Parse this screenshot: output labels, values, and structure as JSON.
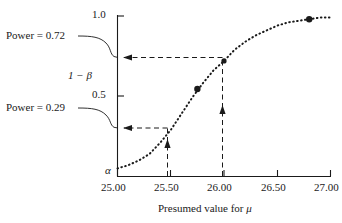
{
  "figure": {
    "type": "power-curve-plot",
    "background": "#ffffff",
    "ink": "#1a1a1a"
  },
  "axes": {
    "x": {
      "title_prefix": "Presumed value for ",
      "title_symbol": "μ",
      "ticks": [
        "25.00",
        "25.50",
        "26.00",
        "26.50",
        "27.00"
      ],
      "range": [
        25.0,
        27.0
      ]
    },
    "y": {
      "ticks": [
        "0.5",
        "1.0"
      ],
      "tick_values": [
        0.5,
        1.0
      ],
      "range": [
        0.0,
        1.0
      ],
      "inner_label": "1 − β",
      "origin_label": "α"
    }
  },
  "callouts": [
    {
      "id": "power-072",
      "text": "Power = 0.72",
      "value": 0.72,
      "target_x": 26.0
    },
    {
      "id": "power-029",
      "text": "Power = 0.29",
      "value": 0.29,
      "target_x": 25.5
    }
  ],
  "chart_data": {
    "type": "line",
    "title": "",
    "subtitle": "",
    "xlabel": "Presumed value for μ",
    "ylabel": "1 − β",
    "xlim": [
      25.0,
      27.0
    ],
    "ylim": [
      0.0,
      1.0
    ],
    "grid": false,
    "legend": null,
    "linestyle": "dotted",
    "series": [
      {
        "name": "Power curve",
        "x": [
          25.0,
          25.1,
          25.2,
          25.3,
          25.4,
          25.5,
          25.6,
          25.7,
          25.8,
          25.9,
          26.0,
          26.1,
          26.2,
          26.3,
          26.4,
          26.5,
          26.6,
          26.7,
          26.8,
          26.9,
          27.0
        ],
        "values": [
          0.05,
          0.07,
          0.1,
          0.14,
          0.21,
          0.29,
          0.39,
          0.49,
          0.58,
          0.66,
          0.72,
          0.79,
          0.84,
          0.88,
          0.91,
          0.94,
          0.96,
          0.97,
          0.98,
          0.99,
          0.99
        ]
      }
    ],
    "markers": [
      {
        "x": 25.75,
        "y": 0.545,
        "style": "filled-dot"
      },
      {
        "x": 26.0,
        "y": 0.72,
        "style": "filled-dot"
      },
      {
        "x": 26.8,
        "y": 0.98,
        "style": "filled-dot"
      }
    ],
    "annotations": [
      {
        "type": "guide",
        "from_x": 25.5,
        "to_y": 0.29,
        "label": "Power = 0.29"
      },
      {
        "type": "guide",
        "from_x": 26.0,
        "to_y": 0.72,
        "label": "Power = 0.72"
      }
    ],
    "axis_notes": {
      "alpha_at_origin": "α",
      "alpha_value": 0.05
    }
  }
}
